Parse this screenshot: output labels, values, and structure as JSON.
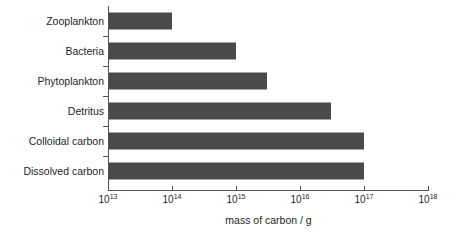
{
  "chart_data": {
    "type": "bar",
    "orientation": "horizontal",
    "title": "",
    "xlabel": "mass of carbon / g",
    "ylabel": "",
    "xscale": "log",
    "xlim": [
      10000000000000.0,
      1e+18
    ],
    "grid": false,
    "legend": null,
    "bar_color": "#4a4a4a",
    "categories": [
      "Zooplankton",
      "Bacteria",
      "Phytoplankton",
      "Detritus",
      "Colloidal carbon",
      "Dissolved carbon"
    ],
    "values": [
      100000000000000.0,
      1000000000000000.0,
      3000000000000000.0,
      3e+16,
      1e+17,
      1e+17
    ],
    "value_labels": [
      "10^14",
      "10^15",
      "3x10^15",
      "3x10^16",
      "10^17",
      "10^17"
    ],
    "xticks": [
      {
        "value": 10000000000000.0,
        "mantissa": "10",
        "exponent": "13"
      },
      {
        "value": 100000000000000.0,
        "mantissa": "10",
        "exponent": "14"
      },
      {
        "value": 1000000000000000.0,
        "mantissa": "10",
        "exponent": "15"
      },
      {
        "value": 1e+16,
        "mantissa": "10",
        "exponent": "16"
      },
      {
        "value": 1e+17,
        "mantissa": "10",
        "exponent": "17"
      },
      {
        "value": 1e+18,
        "mantissa": "10",
        "exponent": "18"
      }
    ]
  }
}
